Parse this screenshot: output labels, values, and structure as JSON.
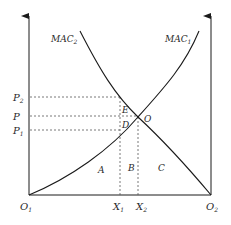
{
  "diagram": {
    "type": "marginal-abatement-cost",
    "curves": [
      {
        "name": "MAC",
        "subscript": "2",
        "direction": "decreasing"
      },
      {
        "name": "MAC",
        "subscript": "1",
        "direction": "increasing"
      }
    ],
    "price_labels": [
      {
        "name": "P",
        "subscript": "2"
      },
      {
        "name": "P",
        "subscript": ""
      },
      {
        "name": "P",
        "subscript": "1"
      }
    ],
    "quantity_labels": [
      {
        "name": "X",
        "subscript": "1"
      },
      {
        "name": "X",
        "subscript": "2"
      }
    ],
    "origins": [
      {
        "name": "O",
        "subscript": "1"
      },
      {
        "name": "O",
        "subscript": "2"
      }
    ],
    "intersection_label": "O",
    "point_labels": {
      "E": "E",
      "D": "D"
    },
    "area_labels": {
      "A": "A",
      "B": "B",
      "C": "C"
    },
    "colors": {
      "line": "#1a1a1a",
      "dashed": "#555555",
      "text": "#2a2a2a"
    }
  }
}
